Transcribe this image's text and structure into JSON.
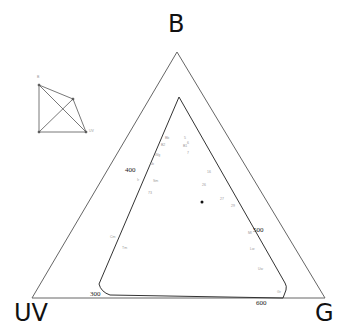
{
  "diagram": {
    "type": "color-triangle",
    "vertices": {
      "top": "B",
      "left": "UV",
      "right": "G"
    },
    "wavelength_labels": [
      {
        "label": "300",
        "x": 90,
        "y": 291
      },
      {
        "label": "400",
        "x": 125,
        "y": 167
      },
      {
        "label": "500",
        "x": 253,
        "y": 227
      },
      {
        "label": "600",
        "x": 256,
        "y": 301
      }
    ],
    "point_labels": [
      {
        "label": "Bb",
        "x": 165,
        "y": 137
      },
      {
        "label": "B2",
        "x": 161,
        "y": 144
      },
      {
        "label": "5",
        "x": 184,
        "y": 137
      },
      {
        "label": "6",
        "x": 187,
        "y": 142
      },
      {
        "label": "B1",
        "x": 183,
        "y": 145
      },
      {
        "label": "Wg",
        "x": 155,
        "y": 154
      },
      {
        "label": "7",
        "x": 187,
        "y": 152
      },
      {
        "label": "5b",
        "x": 150,
        "y": 163
      },
      {
        "label": "Ir",
        "x": 137,
        "y": 179
      },
      {
        "label": "Sm",
        "x": 153,
        "y": 180
      },
      {
        "label": "73",
        "x": 148,
        "y": 192
      },
      {
        "label": "16",
        "x": 207,
        "y": 171
      },
      {
        "label": "26",
        "x": 202,
        "y": 184
      },
      {
        "label": "27",
        "x": 220,
        "y": 198
      },
      {
        "label": "29",
        "x": 231,
        "y": 205
      },
      {
        "label": "Ml",
        "x": 248,
        "y": 232
      },
      {
        "label": "Lw",
        "x": 250,
        "y": 248
      },
      {
        "label": "Uw",
        "x": 258,
        "y": 268
      },
      {
        "label": "Cm",
        "x": 110,
        "y": 236
      },
      {
        "label": "Tm",
        "x": 122,
        "y": 247
      },
      {
        "label": "Gr",
        "x": 277,
        "y": 291
      }
    ],
    "marker": {
      "x": 202,
      "y": 202
    },
    "inset": {
      "axis_labels": [
        "B",
        "UV"
      ]
    },
    "colors": {
      "outline": "#555555",
      "spectral_locus": "#333333",
      "label_text": "#111111"
    }
  }
}
